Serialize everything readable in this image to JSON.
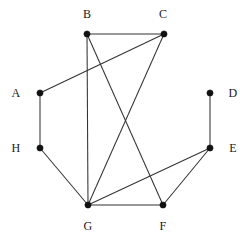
{
  "figure": {
    "kind": "undirected-graph-drawing",
    "background_color": "#ffffff",
    "edge_color": "#333333",
    "node_color": "#111111",
    "label_color": "#1a1a1a",
    "width": 250,
    "height": 241
  },
  "nodes": [
    {
      "id": "A",
      "label": "A",
      "x": 40,
      "y": 93,
      "label_x": 16,
      "label_y": 93
    },
    {
      "id": "B",
      "label": "B",
      "x": 87,
      "y": 34,
      "label_x": 87,
      "label_y": 14
    },
    {
      "id": "C",
      "label": "C",
      "x": 164,
      "y": 34,
      "label_x": 163,
      "label_y": 14
    },
    {
      "id": "D",
      "label": "D",
      "x": 210,
      "y": 93,
      "label_x": 233,
      "label_y": 93
    },
    {
      "id": "E",
      "label": "E",
      "x": 210,
      "y": 148,
      "label_x": 233,
      "label_y": 148
    },
    {
      "id": "F",
      "label": "F",
      "x": 163,
      "y": 205,
      "label_x": 163,
      "label_y": 226
    },
    {
      "id": "G",
      "label": "G",
      "x": 88,
      "y": 205,
      "label_x": 88,
      "label_y": 226
    },
    {
      "id": "H",
      "label": "H",
      "x": 40,
      "y": 148,
      "label_x": 16,
      "label_y": 148
    }
  ],
  "edges": [
    {
      "source": "A",
      "target": "C",
      "x1": 40,
      "y1": 93,
      "x2": 164,
      "y2": 34
    },
    {
      "source": "A",
      "target": "H",
      "x1": 40,
      "y1": 93,
      "x2": 40,
      "y2": 148
    },
    {
      "source": "B",
      "target": "C",
      "x1": 87,
      "y1": 34,
      "x2": 164,
      "y2": 34
    },
    {
      "source": "B",
      "target": "G",
      "x1": 87,
      "y1": 34,
      "x2": 88,
      "y2": 205
    },
    {
      "source": "B",
      "target": "F",
      "x1": 87,
      "y1": 34,
      "x2": 163,
      "y2": 205
    },
    {
      "source": "C",
      "target": "G",
      "x1": 164,
      "y1": 34,
      "x2": 88,
      "y2": 205
    },
    {
      "source": "D",
      "target": "E",
      "x1": 210,
      "y1": 93,
      "x2": 210,
      "y2": 148
    },
    {
      "source": "E",
      "target": "F",
      "x1": 210,
      "y1": 148,
      "x2": 163,
      "y2": 205
    },
    {
      "source": "E",
      "target": "G",
      "x1": 210,
      "y1": 148,
      "x2": 88,
      "y2": 205
    },
    {
      "source": "F",
      "target": "G",
      "x1": 163,
      "y1": 205,
      "x2": 88,
      "y2": 205
    },
    {
      "source": "G",
      "target": "H",
      "x1": 88,
      "y1": 205,
      "x2": 40,
      "y2": 148
    }
  ]
}
